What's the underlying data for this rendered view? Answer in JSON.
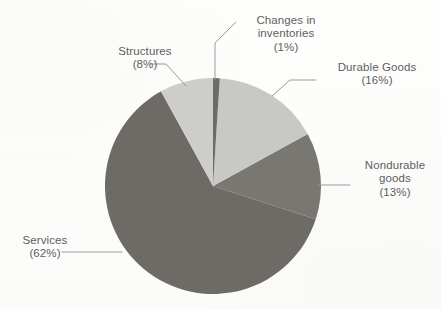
{
  "chart_data": {
    "type": "pie",
    "title": "",
    "subtitle": "",
    "xlabel": "",
    "ylabel": "",
    "legend_position": "none",
    "grid": false,
    "labels_show_percent": true,
    "categories": [
      "Changes in inventories",
      "Durable Goods",
      "Nondurable goods",
      "Services",
      "Structures"
    ],
    "values": [
      1,
      16,
      13,
      62,
      8
    ],
    "units": "percent",
    "slices": [
      {
        "name": "Changes in inventories",
        "label_lines": [
          "Changes in",
          "inventories",
          "(1%)"
        ],
        "percent": 1,
        "percent_text": "(1%)",
        "color": "#6f6c67",
        "start_deg": 0,
        "end_deg": 3.6
      },
      {
        "name": "Durable Goods",
        "label_lines": [
          "Durable Goods",
          "(16%)"
        ],
        "percent": 16,
        "percent_text": "(16%)",
        "color": "#c8c8c6",
        "start_deg": 3.6,
        "end_deg": 61.2
      },
      {
        "name": "Nondurable goods",
        "label_lines": [
          "Nondurable",
          "goods",
          "(13%)"
        ],
        "percent": 13,
        "percent_text": "(13%)",
        "color": "#797772",
        "start_deg": 61.2,
        "end_deg": 108.0
      },
      {
        "name": "Services",
        "label_lines": [
          "Services",
          "(62%)"
        ],
        "percent": 62,
        "percent_text": "(62%)",
        "color": "#6e6b66",
        "start_deg": 108.0,
        "end_deg": 331.2
      },
      {
        "name": "Structures",
        "label_lines": [
          "Structures",
          "(8%)"
        ],
        "percent": 8,
        "percent_text": "(8%)",
        "color": "#cdcdcb",
        "start_deg": 331.2,
        "end_deg": 360.0
      }
    ],
    "geometry": {
      "center_x": 213,
      "center_y": 186,
      "radius": 108
    },
    "colors": {
      "background": "#fdfdfc",
      "label_text": "#5e5e5e",
      "leader_line": "#9b9b9b",
      "light_slice": "#c8c8c6",
      "dark_slice": "#6e6b66"
    }
  }
}
